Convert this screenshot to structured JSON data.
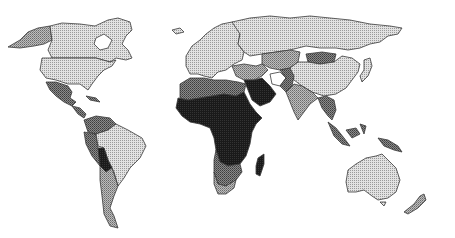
{
  "map": {
    "type": "choropleth",
    "projection": "world",
    "legend": null,
    "classes": [
      {
        "id": "c1",
        "color": "#d4d4d4",
        "label": ""
      },
      {
        "id": "c2",
        "color": "#a9a9a9",
        "label": ""
      },
      {
        "id": "c3",
        "color": "#6e6e6e",
        "label": ""
      },
      {
        "id": "c4",
        "color": "#1e1e1e",
        "label": ""
      }
    ],
    "regions": [
      {
        "name": "Alaska",
        "class": "c2"
      },
      {
        "name": "Canada",
        "class": "c1"
      },
      {
        "name": "Greenland",
        "class": "none"
      },
      {
        "name": "United States",
        "class": "c1"
      },
      {
        "name": "Mexico",
        "class": "c3"
      },
      {
        "name": "Central America",
        "class": "c3"
      },
      {
        "name": "Caribbean",
        "class": "c3"
      },
      {
        "name": "Colombia/Venezuela",
        "class": "c3"
      },
      {
        "name": "Peru/Ecuador",
        "class": "c3"
      },
      {
        "name": "Brazil",
        "class": "c1"
      },
      {
        "name": "Bolivia",
        "class": "c4"
      },
      {
        "name": "Argentina/Chile",
        "class": "c2"
      },
      {
        "name": "Europe",
        "class": "c1"
      },
      {
        "name": "Russia",
        "class": "c1"
      },
      {
        "name": "Central Asia",
        "class": "c2"
      },
      {
        "name": "Mongolia",
        "class": "c3"
      },
      {
        "name": "China",
        "class": "c1"
      },
      {
        "name": "Middle East",
        "class": "c2"
      },
      {
        "name": "Arabian Peninsula",
        "class": "c4"
      },
      {
        "name": "Iran",
        "class": "none"
      },
      {
        "name": "Pakistan/Afghanistan",
        "class": "c3"
      },
      {
        "name": "India",
        "class": "c2"
      },
      {
        "name": "Southeast Asia",
        "class": "c3"
      },
      {
        "name": "Japan",
        "class": "c1"
      },
      {
        "name": "Indonesia",
        "class": "c3"
      },
      {
        "name": "Papua New Guinea",
        "class": "c3"
      },
      {
        "name": "North Africa",
        "class": "c3"
      },
      {
        "name": "Sub-Saharan Africa",
        "class": "c4"
      },
      {
        "name": "Southern Africa",
        "class": "c3"
      },
      {
        "name": "South Africa",
        "class": "c2"
      },
      {
        "name": "Madagascar",
        "class": "c4"
      },
      {
        "name": "Australia",
        "class": "c1"
      },
      {
        "name": "New Zealand",
        "class": "c2"
      }
    ]
  }
}
